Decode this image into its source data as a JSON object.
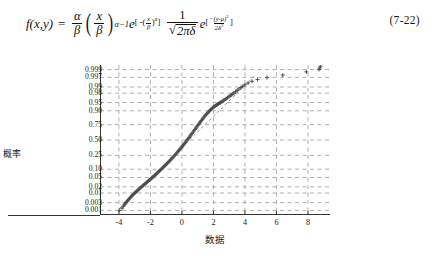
{
  "formula": {
    "label": "f(x,y)",
    "equals": "=",
    "number": "(7-22)",
    "parts": {
      "alpha": "α",
      "beta": "β",
      "x": "x",
      "y": "y",
      "mu": "μ",
      "delta": "δ",
      "pi": "π",
      "e": "e",
      "exp1_open": "[ -(",
      "exp1_close": ")",
      "exp1_power": "α",
      "exp1_end": "]",
      "exp2_open": "[",
      "exp2_close": "]",
      "exp2_num": "(y-μ)",
      "exp2_den": "2δ",
      "alpha_minus_1": "α−1",
      "two": "2",
      "sqrt_body": "2πδ",
      "one": "1",
      "minus": "−"
    },
    "plain_text": "f(x,y) = (α/β)(x/β)^(α-1) e^[-(x/β)^α] (1/√(2πδ)) e^[-(y-μ)²/(2δ²)]"
  },
  "chart_data": {
    "type": "scatter",
    "title": "",
    "xlabel": "数据",
    "ylabel": "概率",
    "xlim": [
      -5.2,
      9.4
    ],
    "ylim": [
      0.0005,
      0.9995
    ],
    "grid": true,
    "legend": null,
    "x_ticks": [
      -4,
      -2,
      0,
      2,
      4,
      6,
      8
    ],
    "x_tick_labels": [
      "-4",
      "-2",
      "0",
      "2",
      "4",
      "6",
      "8"
    ],
    "y_ticks": [
      0.999,
      0.997,
      0.99,
      0.98,
      0.95,
      0.9,
      0.75,
      0.5,
      0.25,
      0.1,
      0.05,
      0.02,
      0.01,
      0.003,
      0.001
    ],
    "y_tick_labels": [
      "0.999",
      "0.997",
      "0.99",
      "0.98",
      "0.95",
      "0.90",
      "0.75",
      "0.50",
      "0.25",
      "0.10",
      "0.05",
      "0.02",
      "0.01",
      "0.003",
      "0.001"
    ],
    "marker": "+",
    "marker_color": "#4a4a4a",
    "reference_line_color": "#8a8a8a",
    "reference_line_style": "dashed",
    "reference_line": {
      "x1": -4.0,
      "y1": 0.0012,
      "x2": 4.6,
      "y2": 0.9975
    },
    "series": [
      {
        "name": "样本数据",
        "points_x": [
          -3.95,
          -3.8,
          -3.72,
          -3.66,
          -3.6,
          -3.55,
          -3.5,
          -3.44,
          -3.38,
          -3.32,
          -3.26,
          -3.2,
          -3.14,
          -3.08,
          -3.02,
          -2.96,
          -2.9,
          -2.84,
          -2.78,
          -2.72,
          -2.66,
          -2.6,
          -2.54,
          -2.48,
          -2.42,
          -2.36,
          -2.3,
          -2.24,
          -2.18,
          -2.12,
          -2.06,
          -2.0,
          -1.94,
          -1.88,
          -1.82,
          -1.76,
          -1.7,
          -1.64,
          -1.58,
          -1.52,
          -1.46,
          -1.4,
          -1.34,
          -1.28,
          -1.22,
          -1.16,
          -1.1,
          -1.04,
          -0.98,
          -0.92,
          -0.86,
          -0.8,
          -0.74,
          -0.68,
          -0.62,
          -0.56,
          -0.5,
          -0.44,
          -0.38,
          -0.32,
          -0.26,
          -0.2,
          -0.14,
          -0.08,
          -0.02,
          0.04,
          0.1,
          0.16,
          0.22,
          0.28,
          0.34,
          0.4,
          0.46,
          0.52,
          0.58,
          0.64,
          0.7,
          0.76,
          0.82,
          0.88,
          0.94,
          1.0,
          1.06,
          1.12,
          1.18,
          1.24,
          1.3,
          1.36,
          1.42,
          1.48,
          1.54,
          1.6,
          1.66,
          1.72,
          1.78,
          1.84,
          1.9,
          1.96,
          2.02,
          2.08,
          2.14,
          2.2,
          2.26,
          2.32,
          2.38,
          2.44,
          2.5,
          2.58,
          2.66,
          2.74,
          2.82,
          2.9,
          2.98,
          3.06,
          3.14,
          3.22,
          3.3,
          3.4,
          3.5,
          3.62,
          3.74,
          3.86,
          4.0,
          4.2,
          4.45,
          4.8,
          5.4,
          6.4,
          7.9,
          8.7,
          8.75,
          8.8
        ],
        "points_y": [
          0.001,
          0.0014,
          0.0018,
          0.0022,
          0.0026,
          0.003,
          0.0034,
          0.0039,
          0.0045,
          0.0052,
          0.006,
          0.0068,
          0.0077,
          0.0086,
          0.0096,
          0.0107,
          0.0118,
          0.013,
          0.0143,
          0.0157,
          0.0172,
          0.0188,
          0.0205,
          0.0223,
          0.0243,
          0.0264,
          0.0287,
          0.0311,
          0.0337,
          0.0365,
          0.0395,
          0.0427,
          0.0461,
          0.0498,
          0.0537,
          0.0579,
          0.0624,
          0.0672,
          0.0723,
          0.0778,
          0.0836,
          0.0898,
          0.0964,
          0.1034,
          0.1108,
          0.1187,
          0.1271,
          0.1359,
          0.1453,
          0.1552,
          0.1656,
          0.1766,
          0.1882,
          0.2004,
          0.2132,
          0.2266,
          0.2406,
          0.2553,
          0.2706,
          0.2866,
          0.3032,
          0.3205,
          0.3384,
          0.3569,
          0.376,
          0.3957,
          0.4159,
          0.4366,
          0.4578,
          0.4793,
          0.5012,
          0.5233,
          0.5456,
          0.568,
          0.5903,
          0.6125,
          0.6344,
          0.656,
          0.6771,
          0.6976,
          0.7175,
          0.7366,
          0.7549,
          0.7724,
          0.7889,
          0.8045,
          0.8191,
          0.8328,
          0.8455,
          0.8573,
          0.8681,
          0.878,
          0.8871,
          0.8953,
          0.9028,
          0.9095,
          0.9156,
          0.921,
          0.9259,
          0.9303,
          0.9343,
          0.9379,
          0.9412,
          0.9442,
          0.947,
          0.9496,
          0.9521,
          0.9556,
          0.959,
          0.9623,
          0.9654,
          0.9684,
          0.9712,
          0.9738,
          0.9762,
          0.9784,
          0.9805,
          0.983,
          0.9852,
          0.9874,
          0.9893,
          0.9908,
          0.9922,
          0.9938,
          0.995,
          0.996,
          0.9969,
          0.9978,
          0.9986,
          0.999,
          0.9992,
          0.9994
        ]
      }
    ]
  }
}
